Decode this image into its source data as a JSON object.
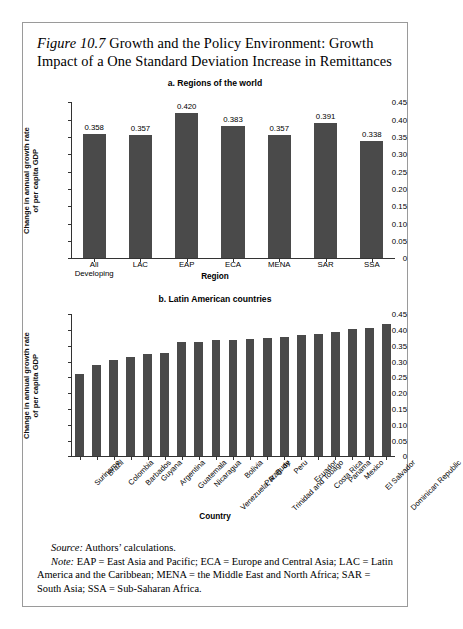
{
  "figure": {
    "number": "Figure 10.7",
    "title": "Growth and the Policy Environment: Growth Impact of a One Standard Deviation Increase in Remittances"
  },
  "footnotes": {
    "source_lead": "Source:",
    "source_text": "Authors’ calculations.",
    "note_lead": "Note:",
    "note_text": "EAP = East Asia and Pacific; ECA = Europe and Central Asia; LAC = Latin America and the Caribbean; MENA = the Middle East and North Africa; SAR = South Asia; SSA = Sub-Saharan Africa."
  },
  "style": {
    "bar_color": "#4a4a4a",
    "axis_color": "#333333",
    "frame_color": "#9a9a9a"
  },
  "chart_data": [
    {
      "type": "bar",
      "title": "a. Regions of the world",
      "xlabel": "Region",
      "ylabel": "Change in annual growth rate of per capita GDP",
      "ylabel_lines": [
        "Change in annual growth rate",
        "of per capita GDP"
      ],
      "ylim": [
        0,
        0.45
      ],
      "yticks": [
        0,
        0.05,
        0.1,
        0.15,
        0.2,
        0.25,
        0.3,
        0.35,
        0.4,
        0.45
      ],
      "ytick_labels": [
        "0",
        "0.05",
        "0.10",
        "0.15",
        "0.20",
        "0.25",
        "0.30",
        "0.35",
        "0.40",
        "0.45"
      ],
      "grid": false,
      "show_value_labels": true,
      "categories": [
        "All Developing",
        "LAC",
        "EAP",
        "ECA",
        "MENA",
        "SAR",
        "SSA"
      ],
      "category_lines": [
        [
          "All",
          "Developing"
        ],
        [
          "LAC"
        ],
        [
          "EAP"
        ],
        [
          "ECA"
        ],
        [
          "MENA"
        ],
        [
          "SAR"
        ],
        [
          "SSA"
        ]
      ],
      "values": [
        0.358,
        0.357,
        0.42,
        0.383,
        0.357,
        0.391,
        0.338
      ],
      "value_labels": [
        "0.358",
        "0.357",
        "0.420",
        "0.383",
        "0.357",
        "0.391",
        "0.338"
      ]
    },
    {
      "type": "bar",
      "title": "b. Latin American countries",
      "xlabel": "Country",
      "ylabel": "Change in annual growth rate of per capita GDP",
      "ylabel_lines": [
        "Change in annual growth rate",
        "of per capita GDP"
      ],
      "ylim": [
        0,
        0.45
      ],
      "yticks": [
        0,
        0.05,
        0.1,
        0.15,
        0.2,
        0.25,
        0.3,
        0.35,
        0.4,
        0.45
      ],
      "ytick_labels": [
        "0",
        "0.05",
        "0.10",
        "0.15",
        "0.20",
        "0.25",
        "0.30",
        "0.35",
        "0.40",
        "0.45"
      ],
      "grid": false,
      "show_value_labels": false,
      "categories": [
        "Suriname",
        "Brazil",
        "Colombia",
        "Barbados",
        "Guyana",
        "Argentina",
        "Guatemala",
        "Nicaragua",
        "Venezuela, R. B. de",
        "Bolivia",
        "Paraguay",
        "Trinidad and Tobago",
        "Peru",
        "Ecuador",
        "Costa Rica",
        "Panama",
        "Mexico",
        "El Salvador",
        "Dominican Republic"
      ],
      "values": [
        0.262,
        0.288,
        0.305,
        0.314,
        0.325,
        0.326,
        0.361,
        0.363,
        0.367,
        0.368,
        0.372,
        0.376,
        0.378,
        0.385,
        0.386,
        0.395,
        0.404,
        0.407,
        0.418
      ]
    }
  ]
}
